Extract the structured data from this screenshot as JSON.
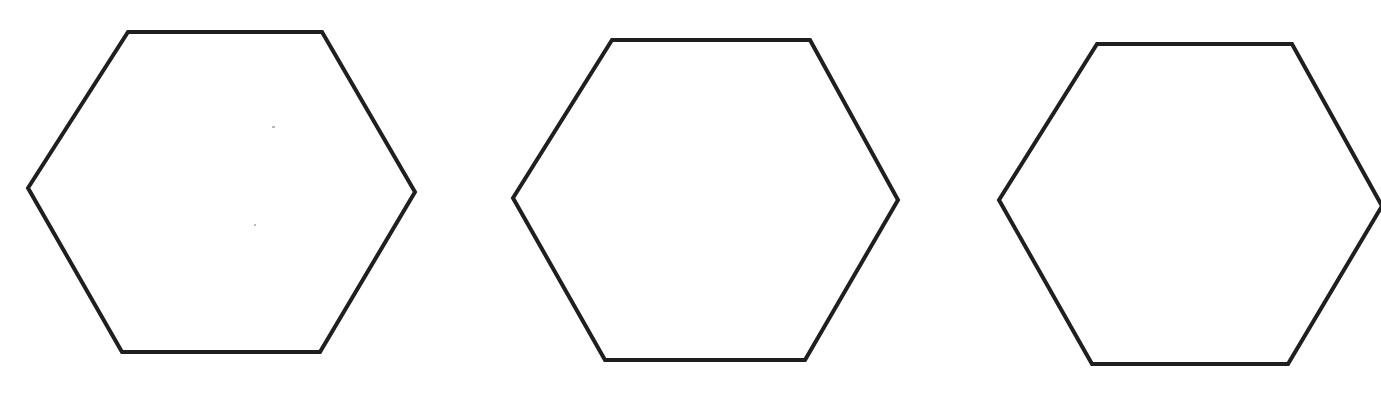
{
  "page": {
    "width": 1381,
    "height": 406,
    "background_color": "#fefefe",
    "paper_color": "#ffffff"
  },
  "style": {
    "stroke_color": "#1f1f1f",
    "stroke_width": 4,
    "fill_color": "#ffffff"
  },
  "figure": {
    "shape_count": 3,
    "shape_kind": "hexagon",
    "orientation": "flat-top",
    "shapes": [
      {
        "id": "hexagon-1",
        "label": "Hexagon 1",
        "clipped": false,
        "points": "128,32 322,32 415,192 320,352 122,352 28,188",
        "vertices": [
          {
            "x": 128,
            "y": 32
          },
          {
            "x": 322,
            "y": 32
          },
          {
            "x": 415,
            "y": 192
          },
          {
            "x": 320,
            "y": 352
          },
          {
            "x": 122,
            "y": 352
          },
          {
            "x": 28,
            "y": 188
          }
        ],
        "bbox": {
          "x": 28,
          "y": 32,
          "width": 387,
          "height": 320
        }
      },
      {
        "id": "hexagon-2",
        "label": "Hexagon 2",
        "clipped": false,
        "points": "612,40 810,40 898,200 805,360 605,360 513,198",
        "vertices": [
          {
            "x": 612,
            "y": 40
          },
          {
            "x": 810,
            "y": 40
          },
          {
            "x": 898,
            "y": 200
          },
          {
            "x": 805,
            "y": 360
          },
          {
            "x": 605,
            "y": 360
          },
          {
            "x": 513,
            "y": 198
          }
        ],
        "bbox": {
          "x": 513,
          "y": 40,
          "width": 385,
          "height": 320
        }
      },
      {
        "id": "hexagon-3",
        "label": "Hexagon 3",
        "clipped": true,
        "clip_edge": "right",
        "points": "1097,44 1292,44 1382,206 1288,364 1092,364 999,200",
        "vertices": [
          {
            "x": 1097,
            "y": 44
          },
          {
            "x": 1292,
            "y": 44
          },
          {
            "x": 1382,
            "y": 206
          },
          {
            "x": 1288,
            "y": 364
          },
          {
            "x": 1092,
            "y": 364
          },
          {
            "x": 999,
            "y": 200
          }
        ],
        "bbox": {
          "x": 999,
          "y": 44,
          "width": 383,
          "height": 320
        }
      }
    ],
    "artifacts": [
      {
        "id": "speck-1",
        "x": 272,
        "y": 126,
        "width": 3,
        "height": 2
      },
      {
        "id": "speck-2",
        "x": 254,
        "y": 224,
        "width": 2,
        "height": 2
      }
    ]
  },
  "accessibility": {
    "figure_caption": "Three hexagons drawn in outline, left to right; the rightmost hexagon is cropped at the right edge of the page."
  }
}
